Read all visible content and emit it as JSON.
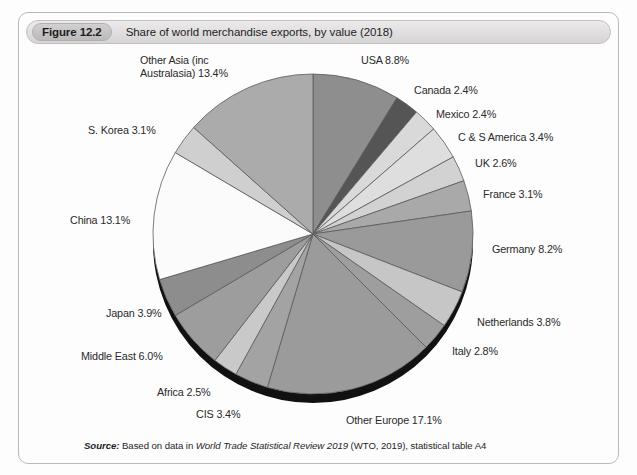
{
  "figure": {
    "number_label": "Figure 12.2",
    "caption": "Share of world merchandise exports, by value (2018)"
  },
  "source": {
    "prefix": "Source:",
    "text_before": " Based on data in ",
    "italic_title": "World Trade Statistical Review 2019",
    "text_after": " (WTO, 2019), statistical table A4"
  },
  "chart_data": {
    "type": "pie",
    "title": "Share of world merchandise exports, by value (2018)",
    "unit": "%",
    "start_angle_deg": 0,
    "direction": "clockwise",
    "legend_position": "outside-labels",
    "grid": false,
    "categories": [
      "USA",
      "Canada",
      "Mexico",
      "C & S America",
      "UK",
      "France",
      "Germany",
      "Netherlands",
      "Italy",
      "Other Europe",
      "CIS",
      "Africa",
      "Middle East",
      "Japan",
      "China",
      "S. Korea",
      "Other Asia (inc Australasia)"
    ],
    "values": [
      8.8,
      2.4,
      2.4,
      3.4,
      2.6,
      3.1,
      8.2,
      3.8,
      2.8,
      17.1,
      3.4,
      2.5,
      6.0,
      3.9,
      13.1,
      3.1,
      13.4
    ],
    "labels": [
      "USA 8.8%",
      "Canada 2.4%",
      "Mexico 2.4%",
      "C & S America 3.4%",
      "UK 2.6%",
      "France 3.1%",
      "Germany 8.2%",
      "Netherlands 3.8%",
      "Italy 2.8%",
      "Other Europe 17.1%",
      "CIS 3.4%",
      "Africa 2.5%",
      "Middle East 6.0%",
      "Japan 3.9%",
      "China 13.1%",
      "S. Korea 3.1%",
      "Other Asia (inc Australasia) 13.4%"
    ],
    "colors": [
      "#8e8e8e",
      "#555555",
      "#d9d9d9",
      "#dedede",
      "#d2d2d2",
      "#a9a9a9",
      "#9a9a9a",
      "#c6c6c6",
      "#9e9e9e",
      "#9b9b9b",
      "#a3a3a3",
      "#c9c9c9",
      "#9d9d9d",
      "#8d8d8d",
      "#fbfbfb",
      "#cfcfcf",
      "#ababab"
    ],
    "stroke_color": "#5a5a5a",
    "depth_shadow_color": "#111111"
  }
}
